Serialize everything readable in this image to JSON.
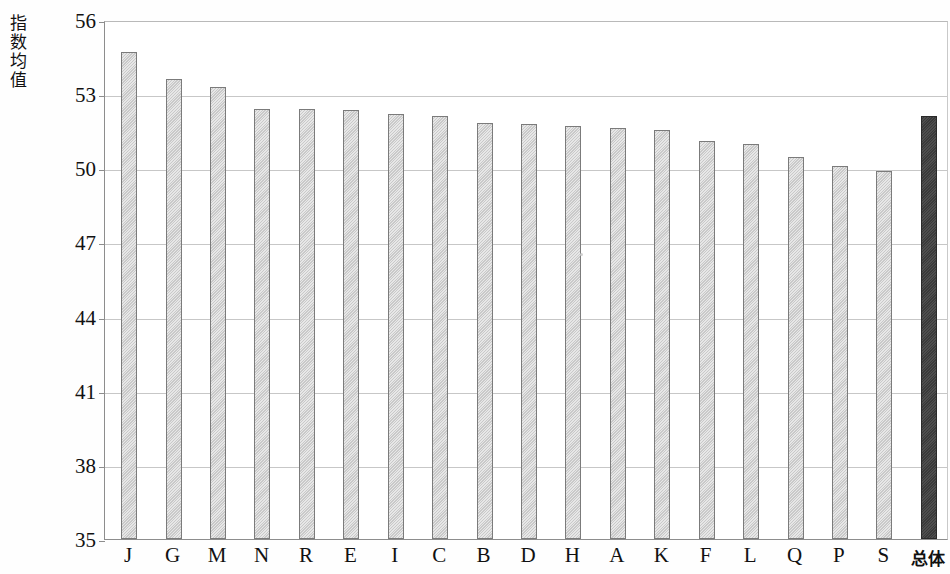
{
  "chart_data": {
    "type": "bar",
    "title": "",
    "xlabel": "",
    "ylabel": "指数均值",
    "ylim": [
      35,
      56
    ],
    "ytick_values": [
      56,
      53,
      50,
      47,
      44,
      41,
      38,
      35
    ],
    "ytick_labels": [
      "56",
      "53",
      "50",
      "47",
      "44",
      "41",
      "38",
      "35"
    ],
    "grid": true,
    "legend": null,
    "categories": [
      "J",
      "G",
      "M",
      "N",
      "R",
      "E",
      "I",
      "C",
      "B",
      "D",
      "H",
      "A",
      "K",
      "F",
      "L",
      "Q",
      "P",
      "S",
      "总体"
    ],
    "values": [
      54.7,
      53.6,
      53.3,
      52.4,
      52.4,
      52.35,
      52.2,
      52.1,
      51.85,
      51.8,
      51.7,
      51.65,
      51.55,
      51.1,
      51.0,
      50.45,
      50.1,
      49.9,
      52.1
    ],
    "series": [
      {
        "name": "指数均值",
        "values": [
          54.7,
          53.6,
          53.3,
          52.4,
          52.4,
          52.35,
          52.2,
          52.1,
          51.85,
          51.8,
          51.7,
          51.65,
          51.55,
          51.1,
          51.0,
          50.45,
          50.1,
          49.9,
          52.1
        ]
      }
    ],
    "bar_colors": [
      "#c9c9c9",
      "#c9c9c9",
      "#c9c9c9",
      "#c9c9c9",
      "#c9c9c9",
      "#c9c9c9",
      "#c9c9c9",
      "#c9c9c9",
      "#c9c9c9",
      "#c9c9c9",
      "#c9c9c9",
      "#c9c9c9",
      "#c9c9c9",
      "#c9c9c9",
      "#c9c9c9",
      "#c9c9c9",
      "#c9c9c9",
      "#c9c9c9",
      "#3a3a3a"
    ],
    "highlight_category": "总体",
    "highlight_color": "#3a3a3a",
    "bar_color": "#c9c9c9",
    "bar_border_color": "#7b7b7b",
    "gridline_color": "#c7c7c7",
    "axis_color": "#8d8d8d"
  }
}
